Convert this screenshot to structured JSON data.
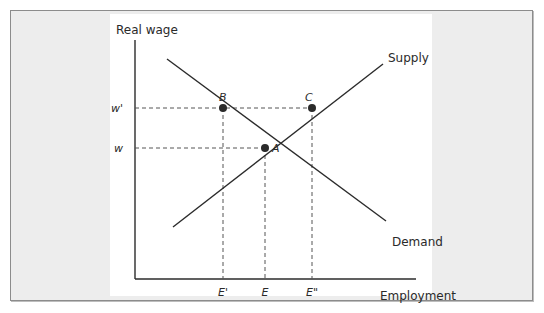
{
  "figure": {
    "y_axis_label": "Real wage",
    "x_axis_label": "Employment",
    "curves": {
      "supply_label": "Supply",
      "demand_label": "Demand"
    },
    "wage_ticks": {
      "w_prime": "w'",
      "w": "w"
    },
    "employment_ticks": {
      "e_prime": "E'",
      "e": "E",
      "e_double_prime": "E\""
    },
    "points": {
      "a": "A",
      "b": "B",
      "c": "C"
    },
    "colors": {
      "line": "#2b2b2b",
      "dash": "#555555",
      "frame_bg": "#ededed",
      "plot_bg": "#ffffff"
    }
  }
}
